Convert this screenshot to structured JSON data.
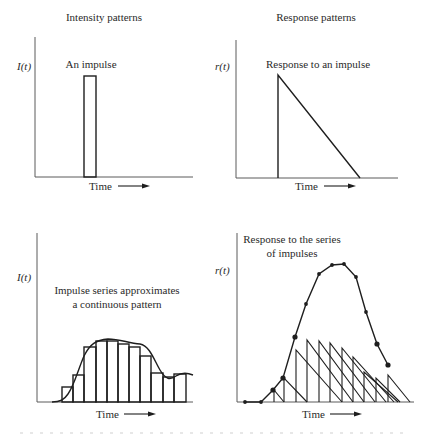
{
  "headers": {
    "left": "Intensity patterns",
    "right": "Response patterns"
  },
  "panels": {
    "top_left": {
      "y_label": "I(t)",
      "x_label": "Time",
      "annotation": "An impulse"
    },
    "top_right": {
      "y_label": "r(t)",
      "x_label": "Time",
      "annotation": "Response to an impulse"
    },
    "bottom_left": {
      "y_label": "I(t)",
      "x_label": "Time",
      "annotation_line1": "Impulse series approximates",
      "annotation_line2": "a continuous pattern"
    },
    "bottom_right": {
      "y_label": "r(t)",
      "x_label": "Time",
      "annotation_line1": "Response to the series",
      "annotation_line2": "of impulses"
    }
  },
  "colors": {
    "ink": "#1e1e1e",
    "axis": "#5a5a5a",
    "text": "#2a2a2a",
    "background": "#ffffff"
  },
  "chart_data": [
    {
      "type": "bar",
      "title": "An impulse",
      "xlabel": "Time",
      "ylabel": "I(t)",
      "description": "Single narrow rectangular pulse of intensity",
      "geometry": {
        "axis_origin": [
          35,
          177
        ],
        "axis_top": 37,
        "axis_right": 193
      },
      "bars": [
        {
          "x0": 84,
          "x1": 96,
          "top": 76
        }
      ]
    },
    {
      "type": "line",
      "title": "Response to an impulse",
      "xlabel": "Time",
      "ylabel": "r(t)",
      "description": "Instantaneous rise then linear decay to zero (triangle)",
      "geometry": {
        "axis_origin": [
          236,
          178
        ],
        "axis_top": 40,
        "axis_right": 398
      },
      "points": [
        [
          278,
          178
        ],
        [
          278,
          75
        ],
        [
          360,
          178
        ]
      ]
    },
    {
      "type": "bar",
      "title": "Impulse series approximates a continuous pattern",
      "xlabel": "Time",
      "ylabel": "I(t)",
      "description": "11 adjacent impulses whose heights follow a smooth continuous intensity curve",
      "geometry": {
        "axis_origin": [
          37,
          402
        ],
        "axis_top": 233,
        "axis_right": 193
      },
      "bars": [
        {
          "x0": 62,
          "x1": 73,
          "top": 387
        },
        {
          "x0": 73,
          "x1": 84,
          "top": 375
        },
        {
          "x0": 84,
          "x1": 96,
          "top": 347
        },
        {
          "x0": 96,
          "x1": 107,
          "top": 341
        },
        {
          "x0": 107,
          "x1": 118,
          "top": 341
        },
        {
          "x0": 118,
          "x1": 129,
          "top": 344
        },
        {
          "x0": 129,
          "x1": 140,
          "top": 347
        },
        {
          "x0": 140,
          "x1": 151,
          "top": 356
        },
        {
          "x0": 151,
          "x1": 163,
          "top": 373
        },
        {
          "x0": 163,
          "x1": 174,
          "top": 377
        },
        {
          "x0": 174,
          "x1": 186,
          "top": 374
        }
      ],
      "curve": "M52,402 C60,402 64,400 68,394 C74,386 78,370 84,356 C90,344 96,340 108,339 C120,339 128,343 140,344 C150,346 154,360 160,370 C166,380 170,380 176,376 C182,372 188,373 193,375"
    },
    {
      "type": "line",
      "title": "Response to the series of impulses",
      "xlabel": "Time",
      "ylabel": "r(t)",
      "description": "Superposition of triangular impulse responses; dots mark the summed response",
      "geometry": {
        "axis_origin": [
          237,
          402
        ],
        "axis_top": 233,
        "axis_right": 414
      },
      "impulse_responses": [
        {
          "x": 274,
          "top": 390,
          "end": 284
        },
        {
          "x": 284,
          "top": 378,
          "end": 307
        },
        {
          "x": 296,
          "top": 350,
          "end": 342
        },
        {
          "x": 307,
          "top": 340,
          "end": 353
        },
        {
          "x": 319,
          "top": 341,
          "end": 364
        },
        {
          "x": 330,
          "top": 343,
          "end": 375
        },
        {
          "x": 342,
          "top": 348,
          "end": 386
        },
        {
          "x": 353,
          "top": 357,
          "end": 394
        },
        {
          "x": 364,
          "top": 372,
          "end": 398
        },
        {
          "x": 376,
          "top": 378,
          "end": 400
        },
        {
          "x": 388,
          "top": 375,
          "end": 410
        }
      ],
      "sum_points": [
        [
          245,
          402
        ],
        [
          261,
          402
        ],
        [
          273,
          390
        ],
        [
          283,
          378
        ],
        [
          295,
          337
        ],
        [
          306,
          304
        ],
        [
          319,
          274
        ],
        [
          332,
          265
        ],
        [
          344,
          264
        ],
        [
          356,
          277
        ],
        [
          366,
          312
        ],
        [
          377,
          344
        ],
        [
          388,
          365
        ]
      ]
    }
  ]
}
